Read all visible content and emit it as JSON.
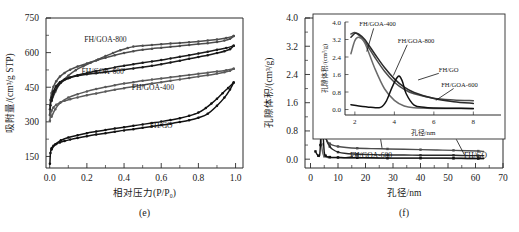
{
  "figure": {
    "panels": [
      {
        "caption": "(e)",
        "xlabel": "相对压力(P/P₀)",
        "ylabel": "吸附量/(cm³/g STP)"
      },
      {
        "caption": "(f)",
        "xlabel": "孔径/nm",
        "ylabel": "孔隙体积/(cm³/g)"
      }
    ]
  },
  "chart_data": [
    {
      "type": "line",
      "panel": "e",
      "title": "",
      "xlabel": "相对压力(P/P₀)",
      "ylabel": "吸附量/(cm³/g STP)",
      "xlim": [
        -0.02,
        1.04
      ],
      "ylim": [
        100,
        750
      ],
      "xticks": [
        0.0,
        0.2,
        0.4,
        0.6,
        0.8,
        1.0
      ],
      "xticklabels": [
        "0.0",
        "0.2",
        "0.4",
        "0.6",
        "0.8",
        "1.0"
      ],
      "yticks": [
        150,
        300,
        450,
        600,
        750
      ],
      "yticklabels": [
        "150",
        "300",
        "450",
        "600",
        "750"
      ],
      "grid": false,
      "legend_position": "inline-annotations",
      "annotations": [
        {
          "text": "FH/GOA-800",
          "x": 0.3,
          "y": 648
        },
        {
          "text": "FH/GOA-600",
          "x": 0.285,
          "y": 508
        },
        {
          "text": "FH/GOA-400",
          "x": 0.555,
          "y": 437
        },
        {
          "text": "FH/GO",
          "x": 0.6,
          "y": 272
        }
      ],
      "series": [
        {
          "name": "FH/GOA-800",
          "color": "#4d4d4d",
          "branch": "adsorption",
          "x": [
            0.001,
            0.004,
            0.01,
            0.02,
            0.035,
            0.055,
            0.08,
            0.11,
            0.15,
            0.2,
            0.25,
            0.3,
            0.35,
            0.4,
            0.45,
            0.5,
            0.55,
            0.6,
            0.65,
            0.7,
            0.75,
            0.8,
            0.85,
            0.9,
            0.94,
            0.97,
            0.99
          ],
          "y": [
            355,
            395,
            425,
            452,
            476,
            496,
            512,
            526,
            540,
            553,
            566,
            578,
            589,
            598,
            606,
            612,
            617,
            621,
            625,
            629,
            633,
            637,
            641,
            646,
            652,
            660,
            672
          ]
        },
        {
          "name": "FH/GOA-800",
          "color": "#4d4d4d",
          "branch": "desorption",
          "x": [
            0.99,
            0.95,
            0.9,
            0.85,
            0.8,
            0.75,
            0.7,
            0.65,
            0.6,
            0.55,
            0.5,
            0.45,
            0.42,
            0.38,
            0.34,
            0.3,
            0.26,
            0.22,
            0.18,
            0.14,
            0.1,
            0.06,
            0.03,
            0.01
          ],
          "y": [
            672,
            663,
            657,
            652,
            648,
            645,
            642,
            639,
            636,
            633,
            630,
            626,
            620,
            610,
            598,
            585,
            570,
            556,
            541,
            524,
            500,
            470,
            430,
            390
          ]
        },
        {
          "name": "FH/GOA-600",
          "color": "#1a1a1a",
          "branch": "adsorption",
          "x": [
            0.001,
            0.004,
            0.01,
            0.02,
            0.035,
            0.055,
            0.08,
            0.11,
            0.15,
            0.2,
            0.25,
            0.3,
            0.35,
            0.4,
            0.45,
            0.5,
            0.55,
            0.6,
            0.65,
            0.7,
            0.75,
            0.8,
            0.85,
            0.9,
            0.94,
            0.97,
            0.99
          ],
          "y": [
            330,
            372,
            404,
            432,
            455,
            472,
            484,
            492,
            500,
            506,
            511,
            516,
            521,
            526,
            531,
            537,
            543,
            550,
            557,
            565,
            573,
            581,
            589,
            598,
            606,
            615,
            630
          ]
        },
        {
          "name": "FH/GOA-600",
          "color": "#1a1a1a",
          "branch": "desorption",
          "x": [
            0.99,
            0.95,
            0.9,
            0.85,
            0.8,
            0.75,
            0.7,
            0.65,
            0.6,
            0.55,
            0.5,
            0.45,
            0.4,
            0.35,
            0.3,
            0.25,
            0.2,
            0.15,
            0.1,
            0.06,
            0.03,
            0.01
          ],
          "y": [
            630,
            620,
            612,
            604,
            596,
            589,
            582,
            575,
            568,
            562,
            556,
            550,
            543,
            536,
            528,
            520,
            511,
            502,
            489,
            470,
            438,
            392
          ]
        },
        {
          "name": "FH/GOA-400",
          "color": "#5a5a5a",
          "branch": "adsorption",
          "x": [
            0.001,
            0.004,
            0.01,
            0.02,
            0.035,
            0.055,
            0.08,
            0.11,
            0.15,
            0.2,
            0.25,
            0.3,
            0.35,
            0.4,
            0.45,
            0.5,
            0.55,
            0.6,
            0.65,
            0.7,
            0.75,
            0.8,
            0.85,
            0.9,
            0.94,
            0.97,
            0.99
          ],
          "y": [
            305,
            330,
            348,
            362,
            374,
            383,
            391,
            398,
            406,
            415,
            423,
            431,
            439,
            446,
            453,
            459,
            466,
            472,
            478,
            484,
            490,
            496,
            502,
            509,
            515,
            521,
            530
          ]
        },
        {
          "name": "FH/GOA-400",
          "color": "#5a5a5a",
          "branch": "desorption",
          "x": [
            0.99,
            0.95,
            0.9,
            0.85,
            0.8,
            0.75,
            0.7,
            0.65,
            0.6,
            0.55,
            0.5,
            0.45,
            0.4,
            0.35,
            0.3,
            0.25,
            0.2,
            0.15,
            0.1,
            0.06,
            0.03,
            0.01
          ],
          "y": [
            530,
            524,
            518,
            513,
            508,
            503,
            498,
            493,
            488,
            483,
            478,
            472,
            466,
            459,
            451,
            442,
            432,
            420,
            405,
            385,
            355,
            322
          ]
        },
        {
          "name": "FH/GO",
          "color": "#111111",
          "branch": "adsorption",
          "x": [
            0.001,
            0.004,
            0.01,
            0.02,
            0.035,
            0.055,
            0.08,
            0.11,
            0.15,
            0.2,
            0.25,
            0.3,
            0.35,
            0.4,
            0.45,
            0.5,
            0.55,
            0.6,
            0.65,
            0.7,
            0.75,
            0.8,
            0.85,
            0.9,
            0.94,
            0.97,
            0.99
          ],
          "y": [
            118,
            165,
            186,
            196,
            204,
            211,
            217,
            223,
            230,
            238,
            245,
            251,
            257,
            263,
            268,
            274,
            280,
            286,
            292,
            299,
            307,
            318,
            335,
            370,
            405,
            440,
            470
          ]
        },
        {
          "name": "FH/GO",
          "color": "#111111",
          "branch": "desorption",
          "x": [
            0.99,
            0.96,
            0.93,
            0.9,
            0.87,
            0.84,
            0.8,
            0.75,
            0.7,
            0.65,
            0.6,
            0.55,
            0.5,
            0.45,
            0.4,
            0.35,
            0.3,
            0.25,
            0.2,
            0.15,
            0.1,
            0.06,
            0.03,
            0.01
          ],
          "y": [
            470,
            447,
            424,
            400,
            379,
            360,
            340,
            326,
            316,
            308,
            301,
            295,
            289,
            283,
            277,
            271,
            265,
            258,
            251,
            242,
            232,
            220,
            203,
            180
          ]
        }
      ]
    },
    {
      "type": "line",
      "panel": "f",
      "title": "",
      "xlabel": "孔径/nm",
      "ylabel": "孔隙体积/(cm³/g)",
      "xlim": [
        -2,
        70
      ],
      "ylim": [
        -0.25,
        4.0
      ],
      "xticks": [
        0,
        10,
        20,
        30,
        40,
        50,
        60,
        70
      ],
      "xticklabels": [
        "0",
        "10",
        "20",
        "30",
        "40",
        "50",
        "60",
        "70"
      ],
      "yticks": [
        0.0,
        0.8,
        1.6,
        2.4,
        3.2,
        4.0
      ],
      "yticklabels": [
        "0.0",
        "0.8",
        "1.6",
        "2.4",
        "3.2",
        "4.0"
      ],
      "grid": false,
      "legend_position": "inline-annotations",
      "annotations": [
        {
          "text": "FH/GOA-400",
          "x": 19.5,
          "y": 0.62
        },
        {
          "text": "FH/GOA-800",
          "x": 48.0,
          "y": 0.62
        },
        {
          "text": "FH/GOA-600",
          "x": 22.0,
          "y": 0.02
        },
        {
          "text": "FH/GO",
          "x": 60.0,
          "y": 0.02
        }
      ],
      "series": [
        {
          "name": "FH/GOA-400",
          "color": "#4d4d4d",
          "x": [
            1.8,
            2.0,
            2.2,
            2.5,
            3.0,
            3.5,
            4.0,
            4.5,
            5.0,
            6.0,
            7.0,
            8.0,
            10,
            13,
            17,
            22,
            28,
            34,
            40,
            46,
            52,
            57,
            61,
            63
          ],
          "y": [
            3.45,
            3.52,
            3.4,
            3.1,
            2.4,
            1.75,
            1.25,
            0.92,
            0.72,
            0.52,
            0.44,
            0.4,
            0.36,
            0.33,
            0.31,
            0.3,
            0.29,
            0.28,
            0.27,
            0.26,
            0.25,
            0.24,
            0.23,
            0.22
          ]
        },
        {
          "name": "FH/GOA-800",
          "color": "#2a2a2a",
          "x": [
            1.8,
            2.0,
            2.2,
            2.5,
            3.0,
            3.5,
            4.0,
            4.5,
            5.0,
            6.0,
            7.0,
            8.0,
            10,
            13,
            17,
            22,
            28,
            34,
            40,
            46,
            52,
            57,
            61,
            63
          ],
          "y": [
            3.3,
            3.48,
            3.45,
            3.2,
            2.55,
            1.92,
            1.4,
            1.02,
            0.78,
            0.5,
            0.36,
            0.28,
            0.2,
            0.16,
            0.14,
            0.13,
            0.12,
            0.12,
            0.11,
            0.11,
            0.11,
            0.1,
            0.1,
            0.1
          ]
        },
        {
          "name": "FH/GOA-600",
          "color": "#6a6a6a",
          "x": [
            1.8,
            2.0,
            2.2,
            2.5,
            3.0,
            3.5,
            4.0,
            4.5,
            5.0,
            6.0,
            7.0,
            8.0,
            10,
            13,
            17,
            22,
            28,
            34,
            40,
            46,
            52,
            57,
            61,
            63
          ],
          "y": [
            2.55,
            3.15,
            3.3,
            3.05,
            1.9,
            0.95,
            0.42,
            0.16,
            0.08,
            0.05,
            0.05,
            0.04,
            0.04,
            0.04,
            0.04,
            0.03,
            0.03,
            0.03,
            0.03,
            0.03,
            0.02,
            0.02,
            0.02,
            0.02
          ]
        },
        {
          "name": "FH/GO",
          "color": "#111111",
          "x": [
            1.8,
            2.2,
            2.8,
            3.3,
            3.6,
            3.9,
            4.2,
            4.4,
            4.6,
            5.0,
            5.5,
            6.0,
            7.0,
            8.0,
            10,
            13,
            17,
            22,
            28,
            34,
            40,
            46,
            52,
            57,
            61,
            63
          ],
          "y": [
            0.22,
            0.16,
            0.1,
            0.1,
            0.4,
            1.05,
            1.52,
            1.3,
            0.72,
            0.2,
            0.1,
            0.07,
            0.06,
            0.05,
            0.05,
            0.04,
            0.04,
            0.04,
            0.03,
            0.03,
            0.03,
            0.03,
            0.03,
            0.02,
            0.02,
            0.02
          ]
        }
      ],
      "inset": {
        "xlabel": "孔径/nm",
        "ylabel": "孔隙体积/(cm³/g)",
        "xlim": [
          1.5,
          9.4
        ],
        "ylim": [
          -0.25,
          4.0
        ],
        "xticks": [
          2,
          4,
          6,
          8
        ],
        "xticklabels": [
          "2",
          "4",
          "6",
          "8"
        ],
        "yticks": [
          0.0,
          0.8,
          1.6,
          2.4,
          3.2,
          4.0
        ],
        "yticklabels": [
          "0.0",
          "0.8",
          "1.6",
          "2.4",
          "3.2",
          "4.0"
        ],
        "annotations": [
          {
            "text": "FH/GOA-400",
            "x": 3.15,
            "y": 3.8
          },
          {
            "text": "FH/GOA-800",
            "x": 5.1,
            "y": 3.05
          },
          {
            "text": "FH/GO",
            "x": 6.75,
            "y": 1.7
          },
          {
            "text": "FH/GOA-600",
            "x": 7.3,
            "y": 1.05
          }
        ]
      }
    }
  ]
}
